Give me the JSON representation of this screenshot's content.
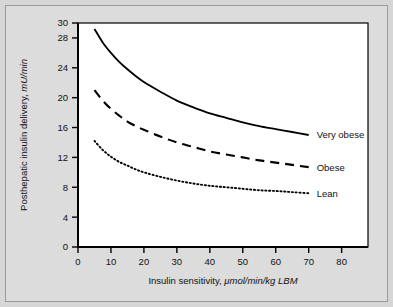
{
  "figure": {
    "background_color": "#d6d6d6",
    "plot_background_color": "#ffffff",
    "frame_color": "#9a9a9a",
    "axis_color": "#000000"
  },
  "chart_data": {
    "type": "line",
    "title": "",
    "xlabel": "Insulin sensitivity, ",
    "xlabel_units": "μmol/min/kg LBM",
    "ylabel": "Posthepatic insulin delivery, ",
    "ylabel_units": "mU/min",
    "xlim": [
      0,
      88
    ],
    "ylim": [
      0,
      31
    ],
    "grid": false,
    "legend_position": "right-inline",
    "xticks": [
      0,
      10,
      20,
      30,
      40,
      50,
      60,
      70,
      80
    ],
    "xtick_labels": [
      "0",
      "10",
      "20",
      "30",
      "40",
      "50",
      "60",
      "70",
      "80"
    ],
    "yticks": [
      0,
      4,
      8,
      12,
      16,
      20,
      24,
      28,
      30
    ],
    "ytick_labels": [
      "0",
      "4",
      "8",
      "12",
      "16",
      "20",
      "24",
      "28",
      "30"
    ],
    "x": [
      5,
      7.5,
      10,
      12.5,
      15,
      17.5,
      20,
      25,
      30,
      35,
      40,
      45,
      50,
      55,
      60,
      65,
      70
    ],
    "series": [
      {
        "name": "Very obese",
        "style": "solid",
        "color": "#000000",
        "values": [
          29.2,
          27.4,
          26.0,
          24.8,
          23.8,
          22.9,
          22.1,
          20.8,
          19.6,
          18.7,
          17.9,
          17.3,
          16.7,
          16.2,
          15.8,
          15.4,
          15.0
        ]
      },
      {
        "name": "Obese",
        "style": "dashed",
        "color": "#000000",
        "values": [
          21.0,
          19.6,
          18.5,
          17.6,
          16.8,
          16.2,
          15.7,
          14.8,
          14.0,
          13.4,
          12.8,
          12.4,
          12.0,
          11.6,
          11.3,
          11.0,
          10.7
        ]
      },
      {
        "name": "Lean",
        "style": "dotted",
        "color": "#000000",
        "values": [
          14.2,
          13.0,
          12.1,
          11.4,
          10.9,
          10.4,
          10.0,
          9.4,
          8.9,
          8.5,
          8.2,
          8.0,
          7.8,
          7.6,
          7.5,
          7.35,
          7.2
        ]
      }
    ],
    "annotations": [
      {
        "text": "Very obese",
        "attached_series": "Very obese",
        "x": 74,
        "y": 15.0
      },
      {
        "text": "Obese",
        "attached_series": "Obese",
        "x": 74,
        "y": 10.7
      },
      {
        "text": "Lean",
        "attached_series": "Lean",
        "x": 74,
        "y": 7.2
      }
    ]
  }
}
